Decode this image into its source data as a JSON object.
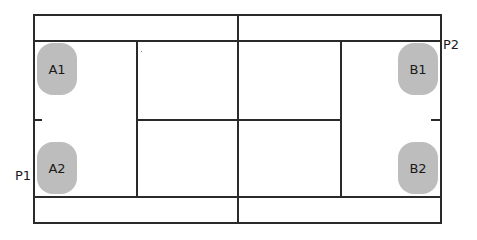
{
  "diagram": {
    "type": "tennis-court-doubles-positions",
    "players": [
      {
        "id": "A1",
        "label": "A1",
        "team": "A",
        "side": "left",
        "position": "top"
      },
      {
        "id": "A2",
        "label": "A2",
        "team": "A",
        "side": "left",
        "position": "bottom"
      },
      {
        "id": "B1",
        "label": "B1",
        "team": "B",
        "side": "right",
        "position": "top"
      },
      {
        "id": "B2",
        "label": "B2",
        "team": "B",
        "side": "right",
        "position": "bottom"
      }
    ],
    "points": [
      {
        "id": "P1",
        "label": "P1",
        "near": "A2"
      },
      {
        "id": "P2",
        "label": "P2",
        "near": "B1"
      }
    ],
    "colors": {
      "lines": "#2a2a2a",
      "player_fill": "#bdbdbd",
      "background": "#ffffff"
    }
  }
}
